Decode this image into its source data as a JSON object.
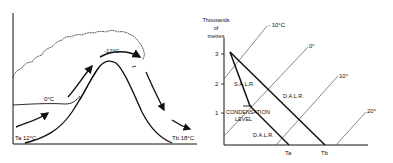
{
  "left_panel": {
    "title": "Foehn effect cross-section over a mountain",
    "labels": {
      "ta": "Ta 12°C",
      "tb": "Tb 18°C",
      "freezing": "0°C",
      "summit": "-12°C"
    },
    "icons": [
      "cloud-outline",
      "mountain-profile",
      "airflow-arrow"
    ]
  },
  "right_panel": {
    "y_axis_label": [
      "Thousands",
      "of",
      "metres"
    ],
    "y_ticks": [
      "1",
      "2",
      "3"
    ],
    "isotherms": [
      "- 10°C",
      "0°",
      "10°",
      "20°"
    ],
    "labels": {
      "salr": "S.A.L.R.",
      "dalr_upper": "D.A.L.R.",
      "dalr_lower": "D.A.L.R.",
      "condensation_1": "CONDENSATION",
      "condensation_2": "LEVEL",
      "ta": "Ta",
      "tb": "Tb"
    }
  },
  "colors": {
    "ink": "#111111",
    "isotherm": "#555555",
    "background": "#ffffff"
  }
}
